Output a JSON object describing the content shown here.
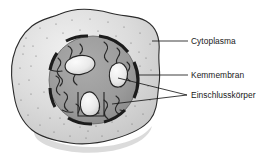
{
  "figure": {
    "background_color": "#ffffff",
    "cell": {
      "name": "Zelle",
      "cytoplasm_fill": "#d4d4d4",
      "cytoplasm_highlight": "#efefef",
      "outline_color": "#2b2b2b",
      "stipple_color": "#6d6d6d"
    },
    "nucleus": {
      "name": "Zellkern",
      "fill": "#9a9a9a",
      "membrane_color": "#202020",
      "chromatin_color": "#2a2a2a"
    },
    "inclusion_bodies": {
      "fill": "#e8e8e8",
      "outline_color": "#242424",
      "count": 3
    }
  },
  "labels": [
    {
      "id": "cytoplasma",
      "text": "Cytoplasma",
      "x": 191,
      "y": 44
    },
    {
      "id": "kernmembran",
      "text": "Kemmembran",
      "x": 191,
      "y": 78
    },
    {
      "id": "einschlusskoerper",
      "text": "Einschlusskörper",
      "x": 191,
      "y": 98
    }
  ],
  "leader_lines": [
    {
      "id": "leader-cytoplasma",
      "d": "M152,41 L188,41"
    },
    {
      "id": "leader-kernmembran",
      "d": "M138,75 L188,75"
    },
    {
      "id": "leader-inclusion-upper",
      "d": "M118,78 L187,95"
    },
    {
      "id": "leader-inclusion-lower",
      "d": "M112,104 L187,95"
    }
  ]
}
